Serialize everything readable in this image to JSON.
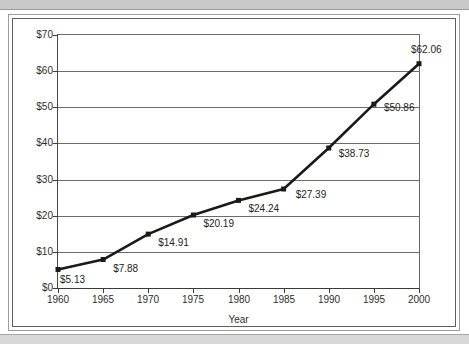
{
  "figure": {
    "background_color": "#ffffff",
    "frame_color": "#5f5f5f",
    "scan_band_color": "#c9c9c9"
  },
  "chart_data": {
    "type": "line",
    "title": "",
    "subtitle": "",
    "xlabel": "Year",
    "ylabel": "",
    "categories": [
      "1960",
      "1965",
      "1970",
      "1975",
      "1980",
      "1985",
      "1990",
      "1995",
      "2000"
    ],
    "x": [
      1960,
      1965,
      1970,
      1975,
      1980,
      1985,
      1990,
      1995,
      2000
    ],
    "values": [
      5.13,
      7.88,
      14.91,
      20.19,
      24.24,
      27.39,
      38.73,
      50.86,
      62.06
    ],
    "point_labels": [
      "$5.13",
      "$7.88",
      "$14.91",
      "$20.19",
      "$24.24",
      "$27.39",
      "$38.73",
      "$50.86",
      "$62.06"
    ],
    "ylim": [
      0,
      70
    ],
    "xlim": [
      1960,
      2000
    ],
    "ytick_values": [
      0,
      10,
      20,
      30,
      40,
      50,
      60,
      70
    ],
    "ytick_labels": [
      "$0",
      "$10",
      "$20",
      "$30",
      "$40",
      "$50",
      "$60",
      "$70"
    ],
    "xtick_labels": [
      "1960",
      "1965",
      "1970",
      "1975",
      "1980",
      "1985",
      "1990",
      "1995",
      "2000"
    ],
    "grid": true,
    "grid_axis": "y",
    "legend": false,
    "legend_position": "none",
    "series": [
      {
        "name": "value",
        "values": [
          5.13,
          7.88,
          14.91,
          20.19,
          24.24,
          27.39,
          38.73,
          50.86,
          62.06
        ],
        "line_color": "#1a1a1a",
        "marker": "square",
        "marker_color": "#1a1a1a"
      }
    ]
  }
}
